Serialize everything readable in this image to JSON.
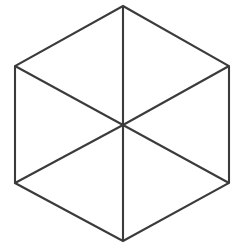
{
  "figure": {
    "name": "hexagon-with-center-spokes",
    "background_color": "#ffffff",
    "stroke_color": "#3b3b3b",
    "fill_color": "#ffffff",
    "stroke_width": "2.1",
    "canvas": {
      "width": 233,
      "height": 245
    },
    "center": {
      "label": "center",
      "x": 123,
      "y": 125
    },
    "vertices": [
      {
        "label": "top",
        "x": 123,
        "y": 6
      },
      {
        "label": "upper-right",
        "x": 229,
        "y": 66
      },
      {
        "label": "lower-right",
        "x": 229,
        "y": 183
      },
      {
        "label": "bottom",
        "x": 123,
        "y": 241
      },
      {
        "label": "lower-left",
        "x": 15,
        "y": 183
      },
      {
        "label": "upper-left",
        "x": 15,
        "y": 66
      }
    ],
    "outline_points": "123,6 229,66 229,183 123,241 15,183 15,66",
    "spokes": [
      {
        "label": "spoke-top",
        "x1": 123,
        "y1": 6,
        "x2": 123,
        "y2": 125
      },
      {
        "label": "spoke-bottom",
        "x1": 123,
        "y1": 241,
        "x2": 123,
        "y2": 125
      },
      {
        "label": "spoke-upper-right",
        "x1": 229,
        "y1": 66,
        "x2": 123,
        "y2": 125
      },
      {
        "label": "spoke-lower-right",
        "x1": 229,
        "y1": 183,
        "x2": 123,
        "y2": 125
      },
      {
        "label": "spoke-upper-left",
        "x1": 15,
        "y1": 66,
        "x2": 123,
        "y2": 125
      },
      {
        "label": "spoke-lower-left",
        "x1": 15,
        "y1": 183,
        "x2": 123,
        "y2": 125
      }
    ],
    "facets": [
      {
        "label": "facet-top-left",
        "points": "123,6 123,125 15,66"
      },
      {
        "label": "facet-top-right",
        "points": "123,6 229,66 123,125"
      },
      {
        "label": "facet-right",
        "points": "229,66 229,183 123,125"
      },
      {
        "label": "facet-bottom-right",
        "points": "123,125 229,183 123,241"
      },
      {
        "label": "facet-bottom-left",
        "points": "123,125 123,241 15,183"
      },
      {
        "label": "facet-left",
        "points": "15,66 123,125 15,183"
      }
    ]
  }
}
